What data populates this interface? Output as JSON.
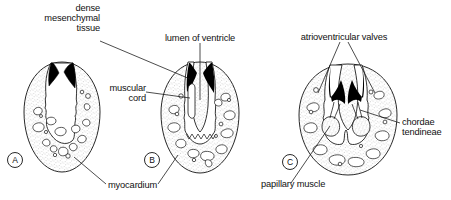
{
  "diagram": {
    "type": "anatomical-line-diagram",
    "stage_count": 3,
    "colors": {
      "ink": "#111111",
      "stipple": "#777777",
      "dense_tissue_fill": "#000000",
      "cavity_fill": "#ffffff",
      "background": "#ffffff"
    }
  },
  "labels": {
    "dense_mesenchymal_tissue": {
      "text": "dense\nmesenchymal\ntissue",
      "lines": [
        "dense",
        "mesenchymal",
        "tissue"
      ],
      "align": "right"
    },
    "lumen_of_ventricle": {
      "text": "lumen of ventricle",
      "lines": [
        "lumen of ventricle"
      ],
      "align": "center"
    },
    "atrioventricular_valves": {
      "text": "atrioventricular valves",
      "lines": [
        "atrioventricular valves"
      ],
      "align": "center"
    },
    "muscular_cord": {
      "text": "muscular\ncord",
      "lines": [
        "muscular",
        "cord"
      ],
      "align": "right"
    },
    "chordae_tendineae": {
      "text": "chordae\ntendineae",
      "lines": [
        "chordae",
        "tendineae"
      ],
      "align": "left"
    },
    "myocardium": {
      "text": "myocardium",
      "lines": [
        "myocardium"
      ],
      "align": "left"
    },
    "papillary_muscle": {
      "text": "papillary muscle",
      "lines": [
        "papillary muscle"
      ],
      "align": "left"
    }
  },
  "stages": [
    {
      "key": "a",
      "letter": "A",
      "caption": ""
    },
    {
      "key": "b",
      "letter": "B",
      "caption": ""
    },
    {
      "key": "c",
      "letter": "C",
      "caption": ""
    }
  ],
  "caption_partial": "",
  "leader_lines": {
    "dense_mesenchymal_tissue_count": 1,
    "lumen_of_ventricle_count": 1,
    "atrioventricular_valves_count": 2,
    "muscular_cord_count": 1,
    "chordae_tendineae_count": 1,
    "myocardium_count": 2,
    "papillary_muscle_count": 1
  }
}
